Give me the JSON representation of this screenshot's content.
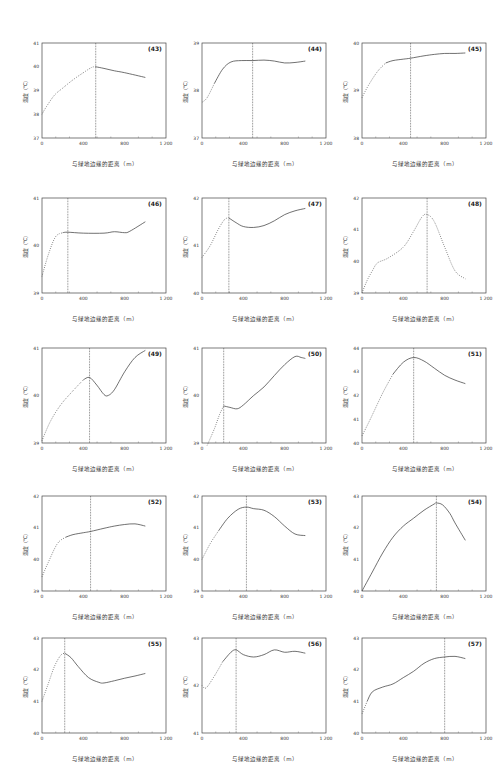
{
  "common": {
    "xlabel": "与绿地边缘的距离（m）",
    "ylabel": "温度（℃）",
    "xticks": [
      "0",
      "400",
      "800",
      "1 200"
    ],
    "xlim": [
      0,
      1200
    ]
  },
  "chart_data": [
    {
      "id": "(43)",
      "type": "line",
      "xlabel": "与绿地边缘的距离（m）",
      "ylabel": "温度（℃）",
      "xlim": [
        0,
        1200
      ],
      "ylim": [
        37,
        41
      ],
      "yticks": [
        37,
        38,
        39,
        40,
        41
      ],
      "threshold_x": 520,
      "x": [
        0,
        40,
        120,
        200,
        300,
        400,
        480,
        520,
        600,
        700,
        800,
        1000
      ],
      "y": [
        38.0,
        38.3,
        38.8,
        39.1,
        39.45,
        39.75,
        39.97,
        40.0,
        39.93,
        39.83,
        39.75,
        39.55
      ],
      "solid_from": 520
    },
    {
      "id": "(44)",
      "type": "line",
      "xlabel": "与绿地边缘的距离（m）",
      "ylabel": "温度（℃）",
      "xlim": [
        0,
        1200
      ],
      "ylim": [
        37,
        39
      ],
      "yticks": [
        37,
        38,
        39
      ],
      "threshold_x": 490,
      "x": [
        0,
        50,
        120,
        200,
        280,
        380,
        490,
        600,
        700,
        800,
        900,
        1000
      ],
      "y": [
        37.75,
        37.85,
        38.15,
        38.45,
        38.6,
        38.63,
        38.63,
        38.64,
        38.62,
        38.58,
        38.59,
        38.62
      ],
      "solid_from": 100
    },
    {
      "id": "(45)",
      "type": "line",
      "xlabel": "与绿地边缘的距离（m）",
      "ylabel": "温度（℃）",
      "xlim": [
        0,
        1200
      ],
      "ylim": [
        38,
        40
      ],
      "yticks": [
        38,
        39,
        40
      ],
      "threshold_x": 470,
      "x": [
        0,
        60,
        150,
        230,
        300,
        400,
        470,
        600,
        700,
        800,
        900,
        1000
      ],
      "y": [
        38.85,
        39.1,
        39.4,
        39.58,
        39.63,
        39.66,
        39.68,
        39.73,
        39.76,
        39.78,
        39.78,
        39.79
      ],
      "solid_from": 230
    },
    {
      "id": "(46)",
      "type": "line",
      "xlabel": "与绿地边缘的距离（m）",
      "ylabel": "温度（℃）",
      "xlim": [
        0,
        1200
      ],
      "ylim": [
        39,
        41
      ],
      "yticks": [
        39,
        40,
        41
      ],
      "threshold_x": 250,
      "x": [
        0,
        60,
        130,
        200,
        250,
        400,
        600,
        700,
        800,
        850,
        1000
      ],
      "y": [
        39.35,
        39.8,
        40.18,
        40.27,
        40.28,
        40.26,
        40.26,
        40.29,
        40.27,
        40.3,
        40.5
      ],
      "solid_from": 200
    },
    {
      "id": "(47)",
      "type": "line",
      "xlabel": "与绿地边缘的距离（m）",
      "ylabel": "温度（℃）",
      "xlim": [
        0,
        1200
      ],
      "ylim": [
        40,
        42
      ],
      "yticks": [
        40,
        41,
        42
      ],
      "threshold_x": 260,
      "x": [
        0,
        80,
        160,
        220,
        260,
        330,
        400,
        500,
        600,
        700,
        800,
        900,
        1000
      ],
      "y": [
        40.75,
        41.0,
        41.35,
        41.55,
        41.58,
        41.48,
        41.4,
        41.38,
        41.42,
        41.52,
        41.65,
        41.73,
        41.78
      ],
      "solid_from": 260
    },
    {
      "id": "(48)",
      "type": "line",
      "xlabel": "与绿地边缘的距离（m）",
      "ylabel": "温度（℃）",
      "xlim": [
        0,
        1200
      ],
      "ylim": [
        39,
        42
      ],
      "yticks": [
        39,
        40,
        41,
        42
      ],
      "threshold_x": 630,
      "x": [
        0,
        50,
        100,
        150,
        250,
        400,
        500,
        580,
        630,
        700,
        800,
        900,
        1000
      ],
      "y": [
        39.0,
        39.4,
        39.7,
        39.95,
        40.1,
        40.45,
        40.95,
        41.4,
        41.48,
        41.25,
        40.45,
        39.7,
        39.45
      ],
      "solid_from": null
    },
    {
      "id": "(49)",
      "type": "line",
      "xlabel": "与绿地边缘的距离（m）",
      "ylabel": "温度（℃）",
      "xlim": [
        0,
        1200
      ],
      "ylim": [
        39,
        41
      ],
      "yticks": [
        39,
        40,
        41
      ],
      "threshold_x": 460,
      "x": [
        0,
        80,
        180,
        300,
        400,
        460,
        530,
        600,
        640,
        700,
        800,
        900,
        1000
      ],
      "y": [
        39.05,
        39.45,
        39.8,
        40.1,
        40.33,
        40.38,
        40.22,
        40.02,
        40.0,
        40.12,
        40.5,
        40.8,
        40.95
      ],
      "solid_from": 400
    },
    {
      "id": "(50)",
      "type": "line",
      "xlabel": "与绿地边缘的距离（m）",
      "ylabel": "温度（℃）",
      "xlim": [
        0,
        1200
      ],
      "ylim": [
        39,
        41
      ],
      "yticks": [
        39,
        40,
        41
      ],
      "threshold_x": 210,
      "x": [
        50,
        120,
        170,
        210,
        270,
        340,
        400,
        500,
        600,
        700,
        800,
        900,
        960,
        1000
      ],
      "y": [
        38.95,
        39.3,
        39.6,
        39.78,
        39.75,
        39.72,
        39.8,
        40.0,
        40.18,
        40.42,
        40.65,
        40.82,
        40.8,
        40.78
      ],
      "solid_from": 210
    },
    {
      "id": "(51)",
      "type": "line",
      "xlabel": "与绿地边缘的距离（m）",
      "ylabel": "温度（℃）",
      "xlim": [
        0,
        1200
      ],
      "ylim": [
        40,
        44
      ],
      "yticks": [
        40,
        41,
        42,
        43,
        44
      ],
      "threshold_x": 500,
      "x": [
        0,
        80,
        200,
        300,
        400,
        500,
        600,
        700,
        800,
        900,
        1000
      ],
      "y": [
        40.3,
        41.0,
        42.1,
        42.9,
        43.4,
        43.6,
        43.45,
        43.15,
        42.85,
        42.65,
        42.5
      ],
      "solid_from": 300
    },
    {
      "id": "(52)",
      "type": "line",
      "xlabel": "与绿地边缘的距离（m）",
      "ylabel": "温度（℃）",
      "xlim": [
        0,
        1200
      ],
      "ylim": [
        39,
        42
      ],
      "yticks": [
        39,
        40,
        41,
        42
      ],
      "threshold_x": 470,
      "x": [
        0,
        60,
        150,
        230,
        300,
        400,
        470,
        600,
        700,
        800,
        900,
        1000
      ],
      "y": [
        39.45,
        39.9,
        40.5,
        40.7,
        40.78,
        40.84,
        40.88,
        40.98,
        41.05,
        41.1,
        41.12,
        41.05
      ],
      "solid_from": 200
    },
    {
      "id": "(53)",
      "type": "line",
      "xlabel": "与绿地边缘的距离（m）",
      "ylabel": "温度（℃）",
      "xlim": [
        0,
        1200
      ],
      "ylim": [
        39,
        42
      ],
      "yticks": [
        39,
        40,
        41,
        42
      ],
      "threshold_x": 430,
      "x": [
        0,
        80,
        160,
        250,
        350,
        430,
        500,
        600,
        700,
        800,
        900,
        1000
      ],
      "y": [
        40.0,
        40.5,
        40.9,
        41.3,
        41.58,
        41.65,
        41.6,
        41.55,
        41.35,
        41.05,
        40.8,
        40.75
      ],
      "solid_from": 150
    },
    {
      "id": "(54)",
      "type": "line",
      "xlabel": "与绿地边缘的距离（m）",
      "ylabel": "温度（℃）",
      "xlim": [
        0,
        1200
      ],
      "ylim": [
        40,
        43
      ],
      "yticks": [
        40,
        41,
        42,
        43
      ],
      "threshold_x": 720,
      "x": [
        0,
        100,
        200,
        300,
        400,
        500,
        600,
        700,
        720,
        780,
        850,
        900,
        1000
      ],
      "y": [
        40.0,
        40.6,
        41.2,
        41.7,
        42.05,
        42.3,
        42.55,
        42.75,
        42.78,
        42.72,
        42.45,
        42.15,
        41.6
      ],
      "solid_from": 0
    },
    {
      "id": "(55)",
      "type": "line",
      "xlabel": "与绿地边缘的距离（m）",
      "ylabel": "温度（℃）",
      "xlim": [
        0,
        1200
      ],
      "ylim": [
        40,
        43
      ],
      "yticks": [
        40,
        41,
        42,
        43
      ],
      "threshold_x": 220,
      "x": [
        0,
        60,
        120,
        180,
        220,
        280,
        350,
        450,
        550,
        600,
        700,
        800,
        900,
        1000
      ],
      "y": [
        41.0,
        41.55,
        42.1,
        42.45,
        42.52,
        42.38,
        42.1,
        41.75,
        41.6,
        41.58,
        41.65,
        41.73,
        41.8,
        41.88
      ],
      "solid_from": 220
    },
    {
      "id": "(56)",
      "type": "line",
      "xlabel": "与绿地边缘的距离（m）",
      "ylabel": "温度（℃）",
      "xlim": [
        0,
        1200
      ],
      "ylim": [
        41,
        43
      ],
      "yticks": [
        41,
        42,
        43
      ],
      "threshold_x": 330,
      "x": [
        0,
        40,
        120,
        200,
        280,
        330,
        400,
        500,
        600,
        700,
        800,
        900,
        1000
      ],
      "y": [
        42.0,
        41.95,
        42.2,
        42.5,
        42.7,
        42.75,
        42.65,
        42.6,
        42.65,
        42.75,
        42.7,
        42.72,
        42.68
      ],
      "solid_from": 150
    },
    {
      "id": "(57)",
      "type": "line",
      "xlabel": "与绿地边缘的距离（m）",
      "ylabel": "温度（℃）",
      "xlim": [
        0,
        1200
      ],
      "ylim": [
        40,
        43
      ],
      "yticks": [
        40,
        41,
        42,
        43
      ],
      "threshold_x": 800,
      "x": [
        0,
        50,
        100,
        200,
        300,
        400,
        500,
        600,
        700,
        800,
        900,
        1000
      ],
      "y": [
        40.6,
        41.0,
        41.3,
        41.45,
        41.55,
        41.75,
        41.95,
        42.2,
        42.35,
        42.4,
        42.42,
        42.35
      ],
      "solid_from": 50
    }
  ]
}
